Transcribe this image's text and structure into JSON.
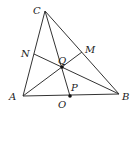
{
  "diagram": {
    "type": "triangle-cevians",
    "points": {
      "A": {
        "x": 23,
        "y": 96
      },
      "B": {
        "x": 119,
        "y": 94
      },
      "C": {
        "x": 45,
        "y": 11
      },
      "N": {
        "x": 34,
        "y": 54
      },
      "M": {
        "x": 82,
        "y": 52
      },
      "Q": {
        "x": 62,
        "y": 67
      },
      "P": {
        "x": 70,
        "y": 96
      }
    },
    "labels": {
      "A": "A",
      "B": "B",
      "C": "C",
      "N": "N",
      "M": "M",
      "Q": "Q",
      "P": "P",
      "O": "O"
    },
    "segments": [
      [
        "A",
        "B"
      ],
      [
        "B",
        "C"
      ],
      [
        "C",
        "A"
      ],
      [
        "C",
        "P"
      ],
      [
        "N",
        "B"
      ],
      [
        "A",
        "M"
      ]
    ],
    "dots": [
      "Q",
      "P"
    ],
    "colors": {
      "stroke": "#333333",
      "label": "#222222",
      "background": "#ffffff"
    }
  }
}
